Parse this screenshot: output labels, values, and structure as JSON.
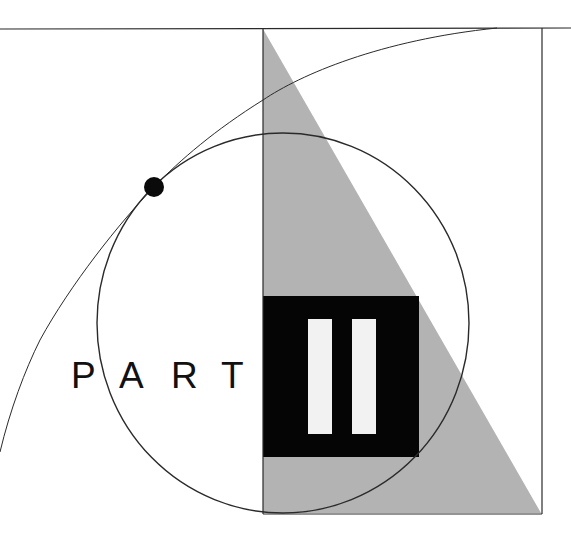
{
  "title": {
    "word": "PART",
    "letters": [
      "P",
      "A",
      "R",
      "T"
    ],
    "numeral": "II"
  },
  "colors": {
    "background": "#ffffff",
    "line": "#2a2a2a",
    "triangle_fill": "#b3b3b3",
    "block_fill": "#050505",
    "bar_fill": "#f2f2f2",
    "dot_fill": "#0a0a0a",
    "text": "#111111"
  }
}
